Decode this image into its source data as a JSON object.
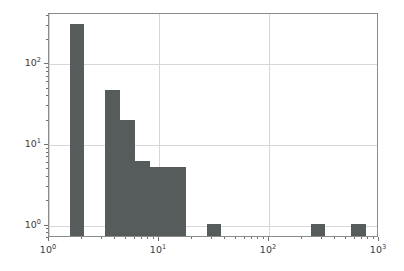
{
  "chart_data": {
    "type": "bar",
    "title": "",
    "subtitle": "",
    "xlabel": "",
    "ylabel": "",
    "xscale": "log",
    "yscale": "log",
    "xlim": [
      1,
      1000
    ],
    "ylim": [
      0.7,
      420
    ],
    "grid": true,
    "legend": null,
    "bar_color": "#565b5c",
    "grid_color": "#d6d6dd",
    "axes_color": "#8b8b8b",
    "xticks": [
      {
        "value": 1,
        "label": "10",
        "exp": "0"
      },
      {
        "value": 10,
        "label": "10",
        "exp": "1"
      },
      {
        "value": 100,
        "label": "10",
        "exp": "2"
      },
      {
        "value": 1000,
        "label": "10",
        "exp": "3"
      }
    ],
    "yticks": [
      {
        "value": 1,
        "label": "10",
        "exp": "0"
      },
      {
        "value": 10,
        "label": "10",
        "exp": "1"
      },
      {
        "value": 100,
        "label": "10",
        "exp": "2"
      }
    ],
    "bins": [
      {
        "x_start": 1.55,
        "x_end": 2.1,
        "value": 300
      },
      {
        "x_start": 3.25,
        "x_end": 4.45,
        "value": 45
      },
      {
        "x_start": 4.45,
        "x_end": 6.05,
        "value": 19
      },
      {
        "x_start": 6.05,
        "x_end": 8.25,
        "value": 6
      },
      {
        "x_start": 8.25,
        "x_end": 17.5,
        "value": 5
      },
      {
        "x_start": 27.0,
        "x_end": 36.5,
        "value": 1
      },
      {
        "x_start": 240.0,
        "x_end": 325.0,
        "value": 1
      },
      {
        "x_start": 560.0,
        "x_end": 760.0,
        "value": 1
      }
    ]
  }
}
